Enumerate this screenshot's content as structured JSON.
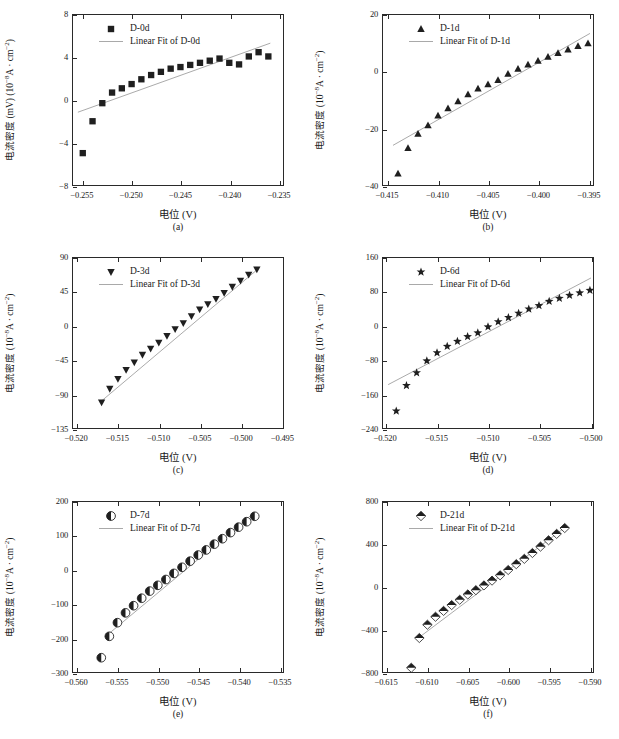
{
  "figure": {
    "panel_count": 6,
    "marker_color": "#1f1f1f",
    "fit_line_color": "#a9a9a9",
    "axis_color": "#2a2a2a"
  },
  "common": {
    "xlabel": "电位 (V)",
    "ylabel_prefix": "电流密度",
    "ylabel_unit_a": "(10",
    "ylabel_unit_b": "A · cm",
    "fit_prefix": "Linear Fit of"
  },
  "chart_data": [
    {
      "id": "a",
      "type": "scatter",
      "caption": "(a)",
      "title": "",
      "series_name": "D-0d",
      "fit_name": "Linear Fit of D-0d",
      "marker": "square",
      "xlabel": "电位 (V)",
      "ylabel": "电流密度 (mV) (10⁻⁸A · cm⁻²)",
      "ylabel_main": "电流密度 (mV) (10",
      "ylabel_exp": "-8",
      "ylabel_tail": "A · cm",
      "ylabel_exp2": "-2",
      "ylabel_close": ")",
      "xlim": [
        -0.256,
        -0.2345
      ],
      "ylim": [
        -8,
        8
      ],
      "xticks": [
        -0.255,
        -0.25,
        -0.245,
        -0.24,
        -0.235
      ],
      "xticklabels": [
        "-0.255",
        "-0.250",
        "-0.245",
        "-0.240",
        "-0.235"
      ],
      "yticks": [
        -8,
        -4,
        0,
        4,
        8
      ],
      "yticklabels": [
        "-8",
        "-4",
        "0",
        "4",
        "8"
      ],
      "grid": false,
      "legend_position": "top-left",
      "x": [
        -0.255,
        -0.254,
        -0.253,
        -0.252,
        -0.251,
        -0.25,
        -0.249,
        -0.248,
        -0.247,
        -0.246,
        -0.245,
        -0.244,
        -0.243,
        -0.242,
        -0.241,
        -0.24,
        -0.239,
        -0.238,
        -0.237,
        -0.236
      ],
      "y": [
        -5.0,
        -2.0,
        -0.3,
        0.7,
        1.1,
        1.5,
        1.95,
        2.35,
        2.65,
        2.95,
        3.1,
        3.3,
        3.5,
        3.7,
        3.9,
        3.5,
        3.35,
        4.1,
        4.5,
        4.1
      ],
      "fit": {
        "x": [
          -0.2555,
          -0.2358
        ],
        "y": [
          -1.15,
          5.35
        ]
      }
    },
    {
      "id": "b",
      "type": "scatter",
      "caption": "(b)",
      "title": "",
      "series_name": "D-1d",
      "fit_name": "Linear Fit of D-1d",
      "marker": "triangle-up",
      "xlabel": "电位 (V)",
      "ylabel": "电流密度 (10⁻⁸A · cm⁻²)",
      "ylabel_main": "电流密度 (10",
      "ylabel_exp": "-8",
      "ylabel_tail": "A · cm",
      "ylabel_exp2": "-2",
      "ylabel_close": ")",
      "xlim": [
        -0.4155,
        -0.3945
      ],
      "ylim": [
        -40,
        20
      ],
      "xticks": [
        -0.415,
        -0.41,
        -0.405,
        -0.4,
        -0.395
      ],
      "xticklabels": [
        "-0.415",
        "-0.410",
        "-0.405",
        "-0.400",
        "-0.395"
      ],
      "yticks": [
        -40,
        -20,
        0,
        20
      ],
      "yticklabels": [
        "-40",
        "-20",
        "0",
        "20"
      ],
      "grid": false,
      "legend_position": "top-left",
      "x": [
        -0.414,
        -0.413,
        -0.412,
        -0.411,
        -0.41,
        -0.409,
        -0.408,
        -0.407,
        -0.406,
        -0.405,
        -0.404,
        -0.403,
        -0.402,
        -0.401,
        -0.4,
        -0.399,
        -0.398,
        -0.397,
        -0.396,
        -0.395
      ],
      "y": [
        -36.0,
        -27.0,
        -22.0,
        -19.0,
        -15.5,
        -13.0,
        -10.5,
        -8.0,
        -6.0,
        -4.5,
        -3.0,
        -0.8,
        1.0,
        2.5,
        3.8,
        5.2,
        6.5,
        7.8,
        9.0,
        10.0
      ],
      "fit": {
        "x": [
          -0.4145,
          -0.3948
        ],
        "y": [
          -26.0,
          13.5
        ]
      }
    },
    {
      "id": "c",
      "type": "scatter",
      "caption": "(c)",
      "title": "",
      "series_name": "D-3d",
      "fit_name": "Linear Fit of D-3d",
      "marker": "triangle-down",
      "xlabel": "电位 (V)",
      "ylabel": "电流密度 (10⁻⁸A · cm⁻²)",
      "ylabel_main": "电流密度 (10",
      "ylabel_exp": "-8",
      "ylabel_tail": "A · cm",
      "ylabel_exp2": "-2",
      "ylabel_close": ")",
      "xlim": [
        -0.5205,
        -0.4948
      ],
      "ylim": [
        -135,
        90
      ],
      "xticks": [
        -0.52,
        -0.515,
        -0.51,
        -0.505,
        -0.5,
        -0.495
      ],
      "xticklabels": [
        "-0.520",
        "-0.515",
        "-0.510",
        "-0.505",
        "-0.500",
        "-0.495"
      ],
      "yticks": [
        -135,
        -90,
        -45,
        0,
        45,
        90
      ],
      "yticklabels": [
        "-135",
        "-90",
        "-45",
        "0",
        "45",
        "90"
      ],
      "grid": false,
      "legend_position": "top-left",
      "x": [
        -0.517,
        -0.516,
        -0.515,
        -0.514,
        -0.513,
        -0.512,
        -0.511,
        -0.51,
        -0.509,
        -0.508,
        -0.507,
        -0.506,
        -0.505,
        -0.504,
        -0.503,
        -0.502,
        -0.501,
        -0.5,
        -0.499,
        -0.498
      ],
      "y": [
        -101.0,
        -83.0,
        -70.0,
        -58.0,
        -48.0,
        -38.0,
        -30.0,
        -22.0,
        -13.0,
        -4.0,
        4.0,
        13.0,
        22.0,
        29.0,
        36.0,
        44.0,
        52.0,
        60.0,
        68.0,
        75.0
      ],
      "fit": {
        "x": [
          -0.5172,
          -0.4978
        ],
        "y": [
          -101.0,
          76.0
        ]
      }
    },
    {
      "id": "d",
      "type": "scatter",
      "caption": "(d)",
      "title": "",
      "series_name": "D-6d",
      "fit_name": "Linear Fit of D-6d",
      "marker": "star",
      "xlabel": "电位 (V)",
      "ylabel": "电流密度 (10⁻⁸A · cm⁻²)",
      "ylabel_main": "电流密度 (10",
      "ylabel_exp": "-8",
      "ylabel_tail": "A · cm",
      "ylabel_exp2": "-2",
      "ylabel_close": ")",
      "xlim": [
        -0.5203,
        -0.4997
      ],
      "ylim": [
        -240,
        160
      ],
      "xticks": [
        -0.52,
        -0.515,
        -0.51,
        -0.505,
        -0.5
      ],
      "xticklabels": [
        "-0.520",
        "-0.515",
        "-0.510",
        "-0.505",
        "-0.500"
      ],
      "yticks": [
        -240,
        -160,
        -80,
        0,
        80,
        160
      ],
      "yticklabels": [
        "-240",
        "-160",
        "-80",
        "0",
        "80",
        "160"
      ],
      "grid": false,
      "legend_position": "top-left",
      "x": [
        -0.519,
        -0.518,
        -0.517,
        -0.516,
        -0.515,
        -0.514,
        -0.513,
        -0.512,
        -0.511,
        -0.51,
        -0.509,
        -0.508,
        -0.507,
        -0.506,
        -0.505,
        -0.504,
        -0.503,
        -0.502,
        -0.501,
        -0.5
      ],
      "y": [
        -200.0,
        -140.0,
        -110.0,
        -82.0,
        -63.0,
        -48.0,
        -36.0,
        -25.0,
        -16.0,
        -2.0,
        10.0,
        20.0,
        30.0,
        40.0,
        48.0,
        58.0,
        65.0,
        72.0,
        78.0,
        84.0
      ],
      "fit": {
        "x": [
          -0.5198,
          -0.4999
        ],
        "y": [
          -138.0,
          113.0
        ]
      }
    },
    {
      "id": "e",
      "type": "scatter",
      "caption": "(e)",
      "title": "",
      "series_name": "D-7d",
      "fit_name": "Linear Fit of D-7d",
      "marker": "half-circle",
      "xlabel": "电位 (V)",
      "ylabel": "电流密度 (10⁻⁸A · cm⁻²)",
      "ylabel_main": "电流密度 (10",
      "ylabel_exp": "-8",
      "ylabel_tail": "A · cm",
      "ylabel_exp2": "-2",
      "ylabel_close": ")",
      "xlim": [
        -0.5605,
        -0.5345
      ],
      "ylim": [
        -300,
        200
      ],
      "xticks": [
        -0.56,
        -0.555,
        -0.55,
        -0.545,
        -0.54,
        -0.535
      ],
      "xticklabels": [
        "-0.560",
        "-0.555",
        "-0.550",
        "-0.545",
        "-0.540",
        "-0.535"
      ],
      "yticks": [
        -300,
        -200,
        -100,
        0,
        100,
        200
      ],
      "yticklabels": [
        "-300",
        "-200",
        "-100",
        "0",
        "100",
        "200"
      ],
      "grid": false,
      "legend_position": "top-left",
      "x": [
        -0.557,
        -0.556,
        -0.555,
        -0.554,
        -0.553,
        -0.552,
        -0.551,
        -0.55,
        -0.549,
        -0.548,
        -0.547,
        -0.546,
        -0.545,
        -0.544,
        -0.543,
        -0.542,
        -0.541,
        -0.54,
        -0.539,
        -0.538
      ],
      "y": [
        -258.0,
        -195.0,
        -155.0,
        -126.0,
        -105.0,
        -83.0,
        -62.0,
        -45.0,
        -28.0,
        -10.0,
        8.0,
        26.0,
        44.0,
        59.0,
        76.0,
        92.0,
        110.0,
        126.0,
        142.0,
        158.0
      ],
      "fit": {
        "x": [
          -0.5565,
          -0.5382
        ],
        "y": [
          -196.0,
          166.0
        ]
      }
    },
    {
      "id": "f",
      "type": "scatter",
      "caption": "(f)",
      "title": "",
      "series_name": "D-21d",
      "fit_name": "Linear Fit of D-21d",
      "marker": "diamond-half",
      "xlabel": "电位 (V)",
      "ylabel": "电流密度 (10⁻⁸A · cm⁻²)",
      "ylabel_main": "电流密度 (10",
      "ylabel_exp": "-8",
      "ylabel_tail": "A · cm",
      "ylabel_exp2": "-2",
      "ylabel_close": ")",
      "xlim": [
        -0.6155,
        -0.5895
      ],
      "ylim": [
        -800,
        800
      ],
      "xticks": [
        -0.615,
        -0.61,
        -0.605,
        -0.6,
        -0.595,
        -0.59
      ],
      "xticklabels": [
        "-0.615",
        "-0.610",
        "-0.605",
        "-0.600",
        "-0.595",
        "-0.590"
      ],
      "yticks": [
        -800,
        -400,
        0,
        400,
        800
      ],
      "yticklabels": [
        "-800",
        "-400",
        "0",
        "400",
        "800"
      ],
      "grid": false,
      "legend_position": "top-left",
      "x": [
        -0.612,
        -0.611,
        -0.61,
        -0.609,
        -0.608,
        -0.607,
        -0.606,
        -0.605,
        -0.604,
        -0.603,
        -0.602,
        -0.601,
        -0.6,
        -0.599,
        -0.598,
        -0.597,
        -0.596,
        -0.595,
        -0.594,
        -0.593
      ],
      "y": [
        -760.0,
        -480.0,
        -355.0,
        -280.0,
        -225.0,
        -170.0,
        -120.0,
        -70.0,
        -30.0,
        15.0,
        60.0,
        110.0,
        160.0,
        215.0,
        265.0,
        320.0,
        380.0,
        440.0,
        500.0,
        555.0
      ],
      "fit": {
        "x": [
          -0.6113,
          -0.5928
        ],
        "y": [
          -490.0,
          570.0
        ]
      }
    }
  ]
}
